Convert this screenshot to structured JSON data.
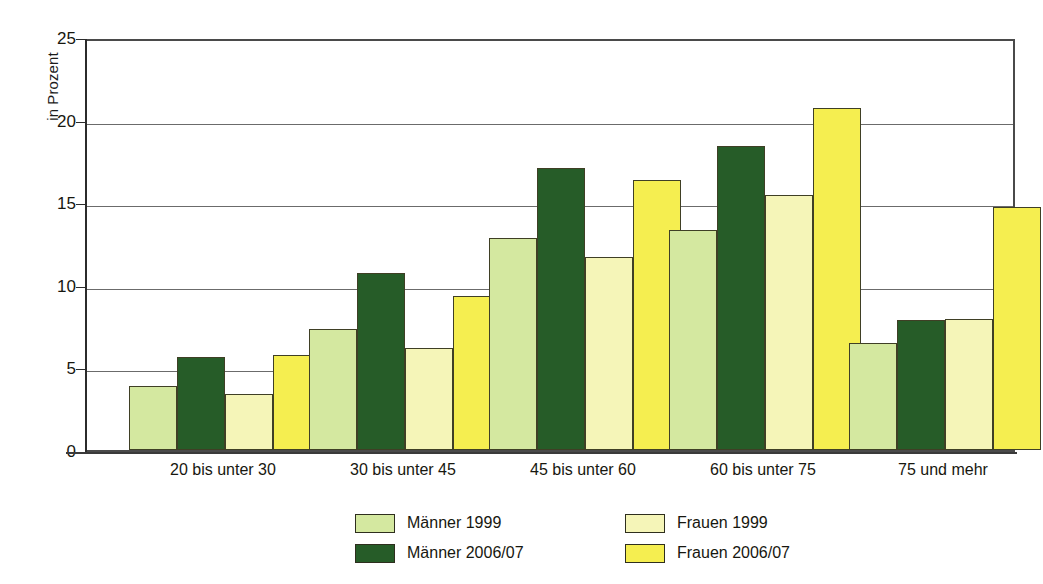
{
  "chart_data": {
    "type": "bar",
    "title": "",
    "subtitle": "",
    "xlabel": "",
    "ylabel": "in Prozent",
    "ylim": [
      0,
      25
    ],
    "yticks": [
      0,
      5,
      10,
      15,
      20,
      25
    ],
    "grid": true,
    "legend_position": "bottom",
    "categories": [
      "20 bis unter 30",
      "30 bis unter 45",
      "45 bis unter 60",
      "60 bis unter 75",
      "75 und mehr"
    ],
    "series": [
      {
        "name": "Männer 1999",
        "color": "#d4e8a0",
        "values": [
          3.9,
          7.35,
          12.85,
          13.3,
          6.45
        ]
      },
      {
        "name": "Männer 2006/07",
        "color": "#265c28",
        "values": [
          5.65,
          10.7,
          17.1,
          18.4,
          7.85
        ]
      },
      {
        "name": "Frauen 1999",
        "color": "#f5f5b8",
        "values": [
          3.4,
          6.2,
          11.7,
          15.45,
          7.95
        ]
      },
      {
        "name": "Frauen 2006/07",
        "color": "#f5ee50",
        "values": [
          5.75,
          9.3,
          16.35,
          20.7,
          14.7
        ]
      }
    ]
  },
  "axis": {
    "y_title": "in Prozent",
    "tick_labels": [
      "25",
      "20",
      "15",
      "10",
      "5",
      "0"
    ]
  },
  "legend": {
    "entries": [
      {
        "label": "Männer 1999",
        "swatch": "#d4e8a0"
      },
      {
        "label": "Frauen 1999",
        "swatch": "#f5f5b8"
      },
      {
        "label": "Männer 2006/07",
        "swatch": "#265c28"
      },
      {
        "label": "Frauen 2006/07",
        "swatch": "#f5ee50"
      }
    ]
  },
  "colors": {
    "maenner_1999": "#d4e8a0",
    "maenner_200607": "#265c28",
    "frauen_1999": "#f5f5b8",
    "frauen_200607": "#f5ee50",
    "axis": "#2b2b2b",
    "grid": "#6b6b6b",
    "background": "#ffffff"
  }
}
